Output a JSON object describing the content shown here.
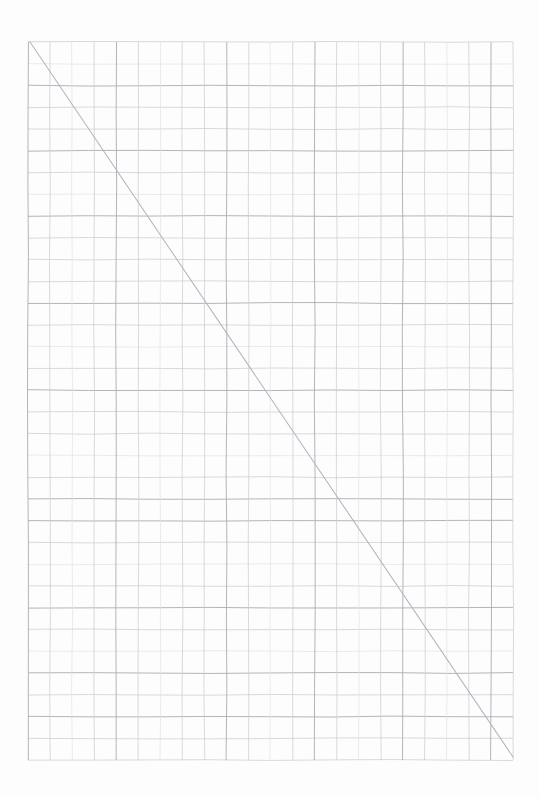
{
  "page": {
    "width": 539,
    "height": 798,
    "background_color": "#ffffff",
    "paper_color": "#fdfdfd",
    "title": ""
  },
  "grid": {
    "name": "graph-paper-grid",
    "left": 28,
    "top": 42,
    "right": 513,
    "bottom": 760,
    "columns": 22,
    "rows": 33,
    "cell_width": 22.05,
    "cell_height": 21.76,
    "minor_line_color": "#c9cdd3",
    "strong_line_color": "#a9adb4",
    "faint_line_color": "#dfe2e6",
    "strong_row_indices": [
      2,
      5,
      8,
      12,
      16,
      21,
      22,
      26,
      29,
      31
    ],
    "faint_row_indices": [
      1,
      7,
      14,
      19,
      24,
      28
    ],
    "strong_column_indices": [
      0,
      4,
      9,
      13,
      17,
      21
    ],
    "faint_column_indices": [
      2,
      6,
      11,
      15,
      19
    ]
  },
  "diagonal": {
    "name": "diagonal-line",
    "color": "#b2b6bc",
    "x1": 30,
    "y1": 42,
    "x2": 513,
    "y2": 757,
    "stroke_width": 1.05
  },
  "chart_data": {
    "type": "line",
    "title": "",
    "subtitle": "",
    "xlabel": "",
    "ylabel": "",
    "grid": true,
    "legend": null,
    "xlim": [
      0,
      22
    ],
    "ylim": [
      0,
      33
    ],
    "categories": [],
    "annotations": [],
    "series": [
      {
        "name": "diagonal",
        "x": [
          0,
          22
        ],
        "values": [
          33,
          0
        ],
        "color": "#b2b6bc"
      }
    ]
  }
}
